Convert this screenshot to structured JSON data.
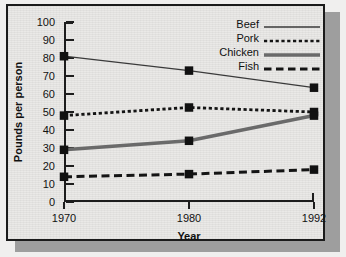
{
  "chart_data": {
    "type": "line",
    "title": "",
    "xlabel": "Year",
    "ylabel": "Pounds per person",
    "categories": [
      "1970",
      "1980",
      "1992"
    ],
    "x": [
      1970,
      1980,
      1992
    ],
    "xlim": [
      1970,
      1992
    ],
    "ylim": [
      0,
      100
    ],
    "yticks": [
      0,
      10,
      20,
      30,
      40,
      50,
      60,
      70,
      80,
      90,
      100
    ],
    "grid": false,
    "legend_position": "top-right",
    "series": [
      {
        "name": "Beef",
        "values": [
          81,
          73,
          63.5
        ],
        "style": "solid-thin",
        "color": "#3a3a3a",
        "marker": "square"
      },
      {
        "name": "Pork",
        "values": [
          48,
          52.5,
          50
        ],
        "style": "dotted",
        "color": "#141414",
        "marker": "square"
      },
      {
        "name": "Chicken",
        "values": [
          29,
          34,
          48
        ],
        "style": "solid-thick",
        "color": "#6a6a6a",
        "marker": "square"
      },
      {
        "name": "Fish",
        "values": [
          14,
          15.5,
          18
        ],
        "style": "dashed",
        "color": "#141414",
        "marker": "square"
      }
    ]
  },
  "legend": {
    "items": [
      {
        "label": "Beef"
      },
      {
        "label": "Pork"
      },
      {
        "label": "Chicken"
      },
      {
        "label": "Fish"
      }
    ]
  },
  "axes": {
    "y_title": "Pounds per person",
    "x_title": "Year",
    "y_tick_labels": [
      "100",
      "90",
      "80",
      "70",
      "60",
      "50",
      "40",
      "30",
      "20",
      "10",
      "0"
    ],
    "x_tick_labels": [
      "1970",
      "1980",
      "1992"
    ]
  },
  "colors": {
    "background": "#e9e8e6",
    "frame": "#1b1b1b",
    "shadow": "#9e9e9e",
    "axis": "#1d1d1d",
    "beef": "#3a3a3a",
    "pork": "#141414",
    "chicken": "#6a6a6a",
    "fish": "#141414",
    "marker": "#111111"
  }
}
